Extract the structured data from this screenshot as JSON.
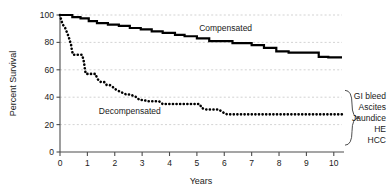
{
  "chart_data": {
    "type": "line",
    "title": "",
    "subtitle": "",
    "xlabel": "Years",
    "ylabel": "Percent Survival",
    "xlim": [
      0,
      10.3
    ],
    "ylim": [
      0,
      100
    ],
    "x_ticks": [
      "0",
      "1",
      "2",
      "3",
      "4",
      "5",
      "6",
      "7",
      "8",
      "9",
      "10"
    ],
    "x_tick_values": [
      0,
      1,
      2,
      3,
      4,
      5,
      6,
      7,
      8,
      9,
      10
    ],
    "y_ticks": [
      "0",
      "20",
      "40",
      "60",
      "80",
      "100"
    ],
    "y_tick_values": [
      0,
      20,
      40,
      60,
      80,
      100
    ],
    "grid": true,
    "grid_axis": "y",
    "grid_values": [
      20,
      40,
      60,
      80,
      100
    ],
    "legend_position": "inline-annotation",
    "series": [
      {
        "name": "Compensated",
        "style": "solid",
        "color": "#000000",
        "label_x": 6.05,
        "label_y": 88,
        "points": [
          [
            0.0,
            100
          ],
          [
            0.45,
            100
          ],
          [
            0.45,
            98.5
          ],
          [
            0.75,
            98.5
          ],
          [
            0.75,
            97.5
          ],
          [
            1.05,
            97.5
          ],
          [
            1.05,
            95.5
          ],
          [
            1.35,
            95.5
          ],
          [
            1.35,
            94.0
          ],
          [
            1.75,
            94.0
          ],
          [
            1.75,
            93.0
          ],
          [
            2.15,
            93.0
          ],
          [
            2.15,
            92.0
          ],
          [
            2.55,
            92.0
          ],
          [
            2.55,
            90.5
          ],
          [
            2.95,
            90.5
          ],
          [
            2.95,
            89.5
          ],
          [
            3.35,
            89.5
          ],
          [
            3.35,
            88.0
          ],
          [
            3.75,
            88.0
          ],
          [
            3.75,
            87.0
          ],
          [
            4.2,
            87.0
          ],
          [
            4.2,
            85.5
          ],
          [
            4.55,
            85.5
          ],
          [
            4.55,
            84.5
          ],
          [
            5.0,
            84.5
          ],
          [
            5.0,
            83.0
          ],
          [
            5.45,
            83.0
          ],
          [
            5.45,
            81.0
          ],
          [
            6.3,
            81.0
          ],
          [
            6.3,
            79.5
          ],
          [
            7.0,
            79.5
          ],
          [
            7.0,
            78.0
          ],
          [
            7.45,
            78.0
          ],
          [
            7.45,
            76.0
          ],
          [
            7.9,
            76.0
          ],
          [
            7.9,
            73.5
          ],
          [
            8.35,
            73.5
          ],
          [
            8.35,
            72.5
          ],
          [
            9.45,
            72.5
          ],
          [
            9.45,
            69.5
          ],
          [
            9.8,
            69.5
          ],
          [
            9.8,
            69.0
          ],
          [
            10.3,
            69.0
          ]
        ]
      },
      {
        "name": "Decompensated",
        "style": "dotted",
        "color": "#000000",
        "label_x": 2.55,
        "label_y": 28,
        "points": [
          [
            0.0,
            100
          ],
          [
            0.05,
            96
          ],
          [
            0.1,
            93
          ],
          [
            0.18,
            91
          ],
          [
            0.22,
            89
          ],
          [
            0.28,
            86
          ],
          [
            0.32,
            84
          ],
          [
            0.36,
            81
          ],
          [
            0.4,
            79
          ],
          [
            0.42,
            76
          ],
          [
            0.45,
            73
          ],
          [
            0.48,
            71
          ],
          [
            0.62,
            71
          ],
          [
            0.72,
            71
          ],
          [
            0.8,
            71
          ],
          [
            0.85,
            68
          ],
          [
            0.88,
            65
          ],
          [
            0.9,
            62
          ],
          [
            0.92,
            59
          ],
          [
            0.95,
            57
          ],
          [
            1.1,
            57
          ],
          [
            1.2,
            57
          ],
          [
            1.3,
            57
          ],
          [
            1.35,
            54
          ],
          [
            1.42,
            52
          ],
          [
            1.5,
            51
          ],
          [
            1.62,
            51
          ],
          [
            1.7,
            49
          ],
          [
            1.8,
            49
          ],
          [
            1.9,
            48
          ],
          [
            2.0,
            46
          ],
          [
            2.1,
            45
          ],
          [
            2.2,
            44
          ],
          [
            2.3,
            43
          ],
          [
            2.42,
            42
          ],
          [
            2.55,
            42
          ],
          [
            2.68,
            41
          ],
          [
            2.8,
            40
          ],
          [
            2.9,
            38
          ],
          [
            3.05,
            38
          ],
          [
            3.2,
            37
          ],
          [
            3.35,
            37
          ],
          [
            3.5,
            37
          ],
          [
            3.62,
            37
          ],
          [
            3.75,
            35
          ],
          [
            3.9,
            35
          ],
          [
            4.05,
            35
          ],
          [
            4.2,
            35
          ],
          [
            4.35,
            35
          ],
          [
            4.5,
            35
          ],
          [
            4.65,
            35
          ],
          [
            4.8,
            35
          ],
          [
            4.95,
            35
          ],
          [
            5.1,
            35
          ],
          [
            5.18,
            32
          ],
          [
            5.35,
            31
          ],
          [
            5.5,
            31
          ],
          [
            5.65,
            31
          ],
          [
            5.8,
            31
          ],
          [
            5.95,
            29
          ],
          [
            6.1,
            27.5
          ],
          [
            6.3,
            27.5
          ],
          [
            6.5,
            27.5
          ],
          [
            6.7,
            27.5
          ],
          [
            6.9,
            27.5
          ],
          [
            7.1,
            27.5
          ],
          [
            7.3,
            27.5
          ],
          [
            7.5,
            27.5
          ],
          [
            7.7,
            27.5
          ],
          [
            7.9,
            27.5
          ],
          [
            8.1,
            27.5
          ],
          [
            8.3,
            27.5
          ],
          [
            8.5,
            27.5
          ],
          [
            8.7,
            27.5
          ],
          [
            8.9,
            27.5
          ],
          [
            9.1,
            27.5
          ],
          [
            9.3,
            27.5
          ],
          [
            9.5,
            27.5
          ],
          [
            9.7,
            27.5
          ],
          [
            9.9,
            27.5
          ],
          [
            10.1,
            27.5
          ],
          [
            10.3,
            27.5
          ]
        ]
      }
    ],
    "annotations": {
      "brace": {
        "label": "decompensation-events-brace",
        "y_top": 45,
        "y_bottom": 5,
        "items": [
          "GI bleed",
          "Ascites",
          "Jaundice",
          "HE",
          "HCC"
        ]
      }
    }
  },
  "colors": {
    "axis": "#4d4d4d",
    "grid": "#c8c8c8",
    "curve": "#000000",
    "text": "#1a1a1a",
    "background": "#ffffff"
  }
}
